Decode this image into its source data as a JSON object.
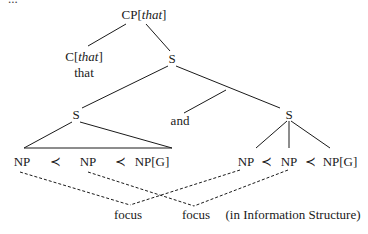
{
  "caption_fragment": "...",
  "tree": {
    "root": {
      "label": "CP",
      "feature": "that"
    },
    "complementizer": {
      "label": "C",
      "feature": "that",
      "word": "that"
    },
    "s_top": {
      "label": "S"
    },
    "s_left": {
      "label": "S"
    },
    "conjunction": {
      "word": "and"
    },
    "s_right": {
      "label": "S"
    },
    "left_np_sequence": [
      "NP",
      "≺",
      "NP",
      "≺",
      "NP[G]"
    ],
    "right_np_sequence": [
      "NP",
      "≺",
      "NP",
      "≺",
      "NP[G]"
    ]
  },
  "focus": {
    "labels": [
      "focus",
      "focus"
    ],
    "note": "(in Information Structure)"
  },
  "colors": {
    "line": "#1a1a1a",
    "background": "#ffffff"
  }
}
